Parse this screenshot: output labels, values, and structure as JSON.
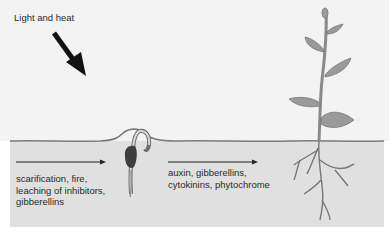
{
  "diagram": {
    "light_label": "Light and heat",
    "stages": [
      {
        "name": "germination-trigger",
        "lines": [
          "scarification, fire,",
          "leaching of inhibitors,",
          "gibberellins"
        ]
      },
      {
        "name": "growth-regulators",
        "lines": [
          "auxin, gibberellins,",
          "cytokinins, phytochrome"
        ]
      }
    ],
    "elements": [
      {
        "name": "light-arrow",
        "icon": "arrow-down-right-icon"
      },
      {
        "name": "germinating-seed",
        "icon": "seedling-sprout-icon"
      },
      {
        "name": "mature-plant",
        "icon": "plant-with-roots-icon"
      }
    ],
    "colors": {
      "sky": "#f3f3f3",
      "soil": "#e0e0e0",
      "soil_line": "#7a7a7a",
      "leaf": "#9a9a9a",
      "stem": "#8a8a8a",
      "arrow": "#111111",
      "text": "#2a2a2a"
    }
  }
}
